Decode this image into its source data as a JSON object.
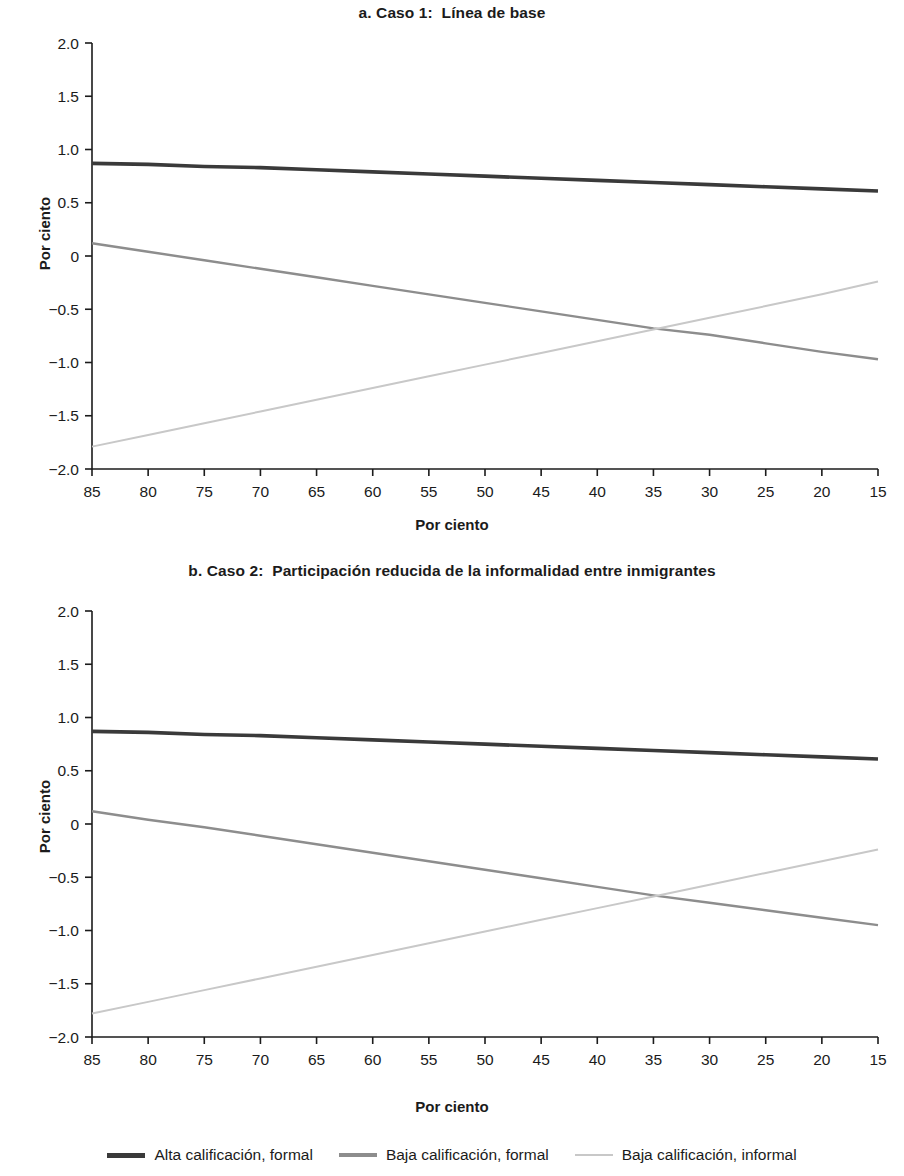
{
  "panels": [
    {
      "title": "a. Caso 1:  Línea de base"
    },
    {
      "title": "b. Caso 2:  Participación reducida de la informalidad entre inmigrantes"
    }
  ],
  "axis": {
    "xlabel": "Por ciento",
    "ylabel": "Por ciento",
    "xticks": [
      "85",
      "80",
      "75",
      "70",
      "65",
      "60",
      "55",
      "50",
      "45",
      "40",
      "35",
      "30",
      "25",
      "20",
      "15"
    ],
    "yticks": [
      "2.0",
      "1.5",
      "1.0",
      "0.5",
      "0",
      "-0.5",
      "-1.0",
      "-1.5",
      "-2.0"
    ]
  },
  "legend": {
    "items": [
      {
        "label": "Alta calificación, formal",
        "color": "#3a3a3a"
      },
      {
        "label": "Baja calificación, formal",
        "color": "#8d8d8d"
      },
      {
        "label": "Baja calificación, informal",
        "color": "#c8c8c8"
      }
    ]
  },
  "chart_data": [
    {
      "type": "line",
      "title": "a. Caso 1:  Línea de base",
      "xlabel": "Por ciento",
      "ylabel": "Por ciento",
      "xlim": [
        85,
        15
      ],
      "ylim": [
        -2.0,
        2.0
      ],
      "x": [
        85,
        80,
        75,
        70,
        65,
        60,
        55,
        50,
        45,
        40,
        35,
        30,
        25,
        20,
        15
      ],
      "grid": false,
      "legend_position": "bottom",
      "series": [
        {
          "name": "Alta calificación, formal",
          "color": "#3a3a3a",
          "width": 3.6,
          "values": [
            0.87,
            0.86,
            0.84,
            0.83,
            0.81,
            0.79,
            0.77,
            0.75,
            0.73,
            0.71,
            0.69,
            0.67,
            0.65,
            0.63,
            0.61
          ]
        },
        {
          "name": "Baja calificación, formal",
          "color": "#8d8d8d",
          "width": 2.4,
          "values": [
            0.12,
            0.04,
            -0.04,
            -0.12,
            -0.2,
            -0.28,
            -0.36,
            -0.44,
            -0.52,
            -0.6,
            -0.68,
            -0.74,
            -0.82,
            -0.9,
            -0.97
          ]
        },
        {
          "name": "Baja calificación, informal",
          "color": "#c8c8c8",
          "width": 2.0,
          "values": [
            -1.79,
            -1.68,
            -1.57,
            -1.46,
            -1.35,
            -1.24,
            -1.13,
            -1.02,
            -0.91,
            -0.8,
            -0.69,
            -0.58,
            -0.47,
            -0.36,
            -0.24
          ]
        }
      ]
    },
    {
      "type": "line",
      "title": "b. Caso 2:  Participación reducida de la informalidad entre inmigrantes",
      "xlabel": "Por ciento",
      "ylabel": "Por ciento",
      "xlim": [
        85,
        15
      ],
      "ylim": [
        -2.0,
        2.0
      ],
      "x": [
        85,
        80,
        75,
        70,
        65,
        60,
        55,
        50,
        45,
        40,
        35,
        30,
        25,
        20,
        15
      ],
      "grid": false,
      "legend_position": "bottom",
      "series": [
        {
          "name": "Alta calificación, formal",
          "color": "#3a3a3a",
          "width": 3.6,
          "values": [
            0.87,
            0.86,
            0.84,
            0.83,
            0.81,
            0.79,
            0.77,
            0.75,
            0.73,
            0.71,
            0.69,
            0.67,
            0.65,
            0.63,
            0.61
          ]
        },
        {
          "name": "Baja calificación, formal",
          "color": "#8d8d8d",
          "width": 2.4,
          "values": [
            0.12,
            0.04,
            -0.03,
            -0.11,
            -0.19,
            -0.27,
            -0.35,
            -0.43,
            -0.51,
            -0.59,
            -0.67,
            -0.74,
            -0.81,
            -0.88,
            -0.95
          ]
        },
        {
          "name": "Baja calificación, informal",
          "color": "#c8c8c8",
          "width": 2.0,
          "values": [
            -1.78,
            -1.67,
            -1.56,
            -1.45,
            -1.34,
            -1.23,
            -1.12,
            -1.01,
            -0.9,
            -0.79,
            -0.68,
            -0.57,
            -0.46,
            -0.35,
            -0.24
          ]
        }
      ]
    }
  ]
}
